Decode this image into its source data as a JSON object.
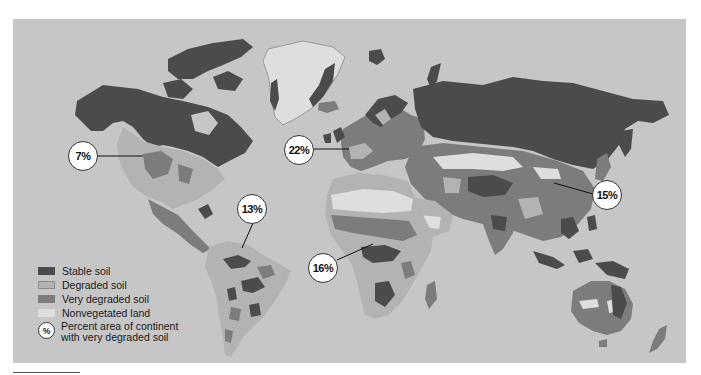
{
  "figure": {
    "background_color": "#c6c6c6"
  },
  "colors": {
    "stable": "#4b4b4b",
    "degraded": "#b3b3b3",
    "very_degraded": "#7c7c7c",
    "nonvegetated": "#dedede",
    "ocean": "#c6c6c6"
  },
  "legend": {
    "items": [
      {
        "key": "stable",
        "label": "Stable soil",
        "color": "#4b4b4b"
      },
      {
        "key": "degraded",
        "label": "Degraded soil",
        "color": "#b3b3b3"
      },
      {
        "key": "very_degraded",
        "label": "Very degraded soil",
        "color": "#7c7c7c"
      },
      {
        "key": "nonvegetated",
        "label": "Nonvegetated land",
        "color": "#dedede"
      }
    ],
    "percent_icon": "%",
    "percent_label_line1": "Percent area of continent",
    "percent_label_line2": "with very degraded soil"
  },
  "callouts": [
    {
      "continent": "North America",
      "value": "7%"
    },
    {
      "continent": "Europe",
      "value": "22%"
    },
    {
      "continent": "South America",
      "value": "13%"
    },
    {
      "continent": "Africa",
      "value": "16%"
    },
    {
      "continent": "Asia",
      "value": "15%"
    }
  ]
}
